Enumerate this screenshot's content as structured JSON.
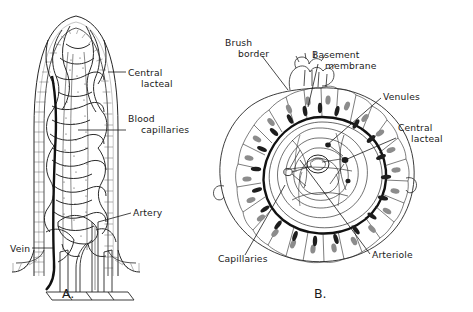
{
  "figure": {
    "background_color": "#ffffff",
    "ink_color": "#1a1a1a"
  },
  "panels": [
    {
      "id": "A",
      "caption": "A.",
      "caption_x": 62,
      "caption_y": 298,
      "description": "Longitudinal section of an intestinal villus showing blood supply and central lacteal",
      "labels": [
        {
          "name": "central-lacteal",
          "lines": [
            "Central",
            "lacteal"
          ],
          "text_x": 128,
          "text_y": 76,
          "align": "start",
          "leader": "M126,72 L108,72"
        },
        {
          "name": "blood-capillaries",
          "lines": [
            "Blood",
            "capillaries"
          ],
          "text_x": 128,
          "text_y": 122,
          "align": "start",
          "leader": "M126,130 L78,130"
        },
        {
          "name": "artery",
          "lines": [
            "Artery"
          ],
          "text_x": 133,
          "text_y": 216,
          "align": "start",
          "leader": "M131,213 L98,222"
        },
        {
          "name": "vein",
          "lines": [
            "Vein"
          ],
          "text_x": 10,
          "text_y": 252,
          "align": "start",
          "leader": "M32,248 L53,248"
        }
      ]
    },
    {
      "id": "B",
      "caption": "B.",
      "caption_x": 314,
      "caption_y": 298,
      "description": "Transverse cross section of an intestinal villus",
      "labels": [
        {
          "name": "brush-border",
          "lines": [
            "Brush",
            "border"
          ],
          "text_x": 225,
          "text_y": 46,
          "align": "start",
          "leader": "M262,56 L288,90"
        },
        {
          "name": "basement-membrane",
          "lines": [
            "Basement",
            "membrane"
          ],
          "text_x": 312,
          "text_y": 58,
          "align": "start",
          "leader": "M318,64 L308,107"
        },
        {
          "name": "venules",
          "lines": [
            "Venules"
          ],
          "text_x": 383,
          "text_y": 100,
          "align": "start",
          "leader": "M381,98 L327,145"
        },
        {
          "name": "central-lacteal-b",
          "lines": [
            "Central",
            "lacteal"
          ],
          "text_x": 398,
          "text_y": 131,
          "align": "start",
          "leader": "M396,138 L345,160"
        },
        {
          "name": "arteriole",
          "lines": [
            "Arteriole"
          ],
          "text_x": 372,
          "text_y": 258,
          "align": "start",
          "leader": "M370,254 L300,160"
        },
        {
          "name": "capillaries",
          "lines": [
            "Capillaries"
          ],
          "text_x": 218,
          "text_y": 262,
          "align": "start",
          "leader": "M245,255 L285,185"
        }
      ]
    }
  ]
}
